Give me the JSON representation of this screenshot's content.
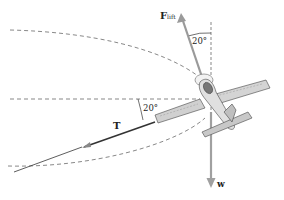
{
  "labels": {
    "lift_main": "F",
    "lift_sub": "lift",
    "tension": "T",
    "weight": "w",
    "angle_top": "20°",
    "angle_left": "20°"
  },
  "colors": {
    "dash": "#555555",
    "force_arrow": "#9a9a9a",
    "tension_line": "#333333",
    "plane_fill": "#d6d6d6",
    "plane_stroke": "#444444"
  }
}
